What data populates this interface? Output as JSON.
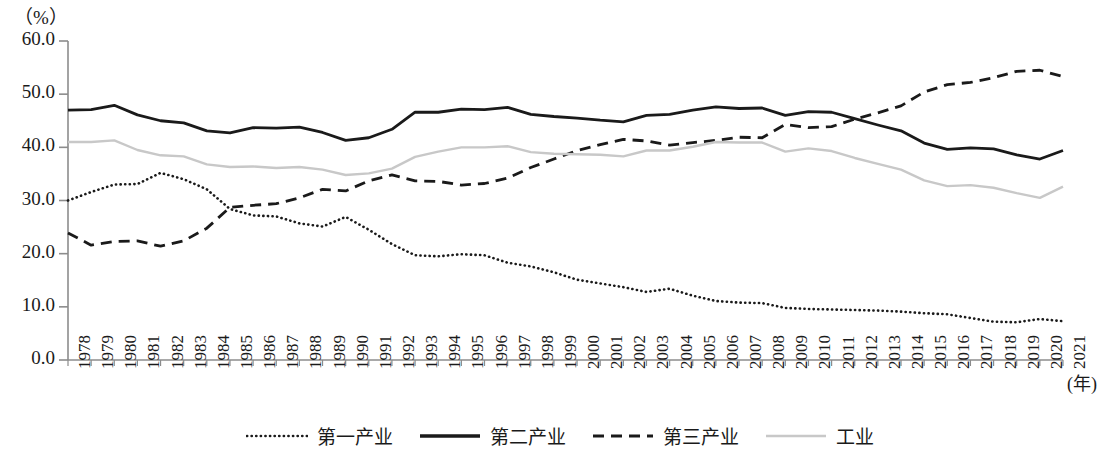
{
  "axis": {
    "unit_label": "（%）",
    "x_axis_title": "(年)",
    "y_ticks": [
      "60.0",
      "50.0",
      "40.0",
      "30.0",
      "20.0",
      "10.0",
      "0.0"
    ]
  },
  "legend": {
    "items": [
      {
        "label": "第一产业",
        "style": "dotted",
        "color": "#1a1a1a",
        "icon": "dotted-line-swatch"
      },
      {
        "label": "第二产业",
        "style": "solid",
        "color": "#1a1a1a",
        "icon": "solid-line-swatch"
      },
      {
        "label": "第三产业",
        "style": "dashed",
        "color": "#1a1a1a",
        "icon": "dashed-line-swatch"
      },
      {
        "label": "工业",
        "style": "solid",
        "color": "#c8c8c8",
        "icon": "gray-line-swatch"
      }
    ]
  },
  "chart_data": {
    "type": "line",
    "title": "",
    "xlabel": "(年)",
    "ylabel": "（%）",
    "ylim": [
      0,
      60
    ],
    "ytick_step": 10,
    "grid": false,
    "legend_position": "bottom",
    "categories": [
      "1978",
      "1979",
      "1980",
      "1981",
      "1982",
      "1983",
      "1984",
      "1985",
      "1986",
      "1987",
      "1988",
      "1989",
      "1990",
      "1991",
      "1992",
      "1993",
      "1994",
      "1995",
      "1996",
      "1997",
      "1998",
      "1999",
      "2000",
      "2001",
      "2002",
      "2003",
      "2004",
      "2005",
      "2006",
      "2007",
      "2008",
      "2009",
      "2010",
      "2011",
      "2012",
      "2013",
      "2014",
      "2015",
      "2016",
      "2017",
      "2018",
      "2019",
      "2020",
      "2021"
    ],
    "series": [
      {
        "name": "第一产业",
        "style": "dotted",
        "color": "#1a1a1a",
        "values": [
          30.0,
          31.6,
          33.0,
          33.1,
          35.2,
          34.0,
          32.1,
          28.4,
          27.2,
          27.0,
          25.7,
          25.1,
          26.9,
          24.5,
          21.8,
          19.7,
          19.5,
          19.9,
          19.7,
          18.3,
          17.6,
          16.5,
          15.1,
          14.4,
          13.7,
          12.8,
          13.4,
          12.1,
          11.1,
          10.8,
          10.7,
          9.8,
          9.6,
          9.5,
          9.4,
          9.3,
          9.1,
          8.8,
          8.6,
          7.9,
          7.2,
          7.1,
          7.7,
          7.3
        ]
      },
      {
        "name": "第二产业",
        "style": "solid",
        "color": "#1a1a1a",
        "values": [
          47.0,
          47.1,
          47.9,
          46.1,
          45.0,
          44.6,
          43.1,
          42.7,
          43.7,
          43.6,
          43.8,
          42.8,
          41.3,
          41.8,
          43.4,
          46.6,
          46.6,
          47.2,
          47.1,
          47.5,
          46.2,
          45.8,
          45.5,
          45.1,
          44.8,
          46.0,
          46.2,
          47.0,
          47.6,
          47.3,
          47.4,
          46.0,
          46.7,
          46.6,
          45.4,
          44.2,
          43.1,
          40.8,
          39.6,
          39.9,
          39.7,
          38.6,
          37.8,
          39.4
        ]
      },
      {
        "name": "第三产业",
        "style": "dashed",
        "color": "#1a1a1a",
        "values": [
          23.9,
          21.6,
          22.3,
          22.4,
          21.4,
          22.4,
          24.8,
          28.7,
          29.1,
          29.4,
          30.5,
          32.1,
          31.8,
          33.7,
          34.8,
          33.7,
          33.6,
          32.9,
          33.2,
          34.2,
          36.2,
          37.8,
          39.4,
          40.5,
          41.5,
          41.2,
          40.4,
          40.9,
          41.3,
          41.9,
          41.8,
          44.3,
          43.7,
          43.9,
          45.3,
          46.5,
          47.8,
          50.4,
          51.8,
          52.2,
          53.1,
          54.3,
          54.5,
          53.3
        ]
      },
      {
        "name": "工业",
        "style": "solid",
        "color": "#c8c8c8",
        "values": [
          41.0,
          41.0,
          41.3,
          39.5,
          38.5,
          38.3,
          36.8,
          36.3,
          36.4,
          36.1,
          36.3,
          35.8,
          34.8,
          35.1,
          36.0,
          38.2,
          39.2,
          40.0,
          40.0,
          40.2,
          39.1,
          38.8,
          38.7,
          38.6,
          38.3,
          39.4,
          39.4,
          40.1,
          41.0,
          40.9,
          40.9,
          39.2,
          39.8,
          39.3,
          38.0,
          36.9,
          35.8,
          33.8,
          32.7,
          32.9,
          32.4,
          31.4,
          30.5,
          32.6
        ]
      }
    ]
  }
}
